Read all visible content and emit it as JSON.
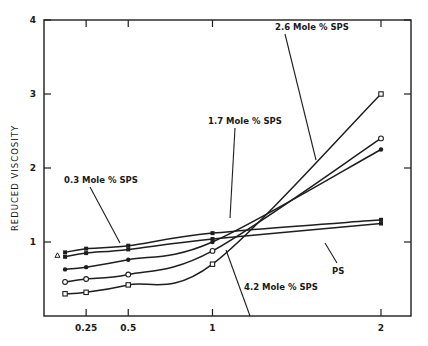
{
  "chart_data": {
    "type": "line",
    "title": "",
    "xlabel": "",
    "ylabel": "REDUCED VISCOSITY",
    "xlim": [
      0,
      2.15
    ],
    "ylim": [
      0,
      4
    ],
    "x_ticks": [
      0.25,
      0.5,
      1,
      2
    ],
    "x_tick_labels": [
      "0.25",
      "0.5",
      "1",
      "2"
    ],
    "y_ticks": [
      1,
      2,
      3,
      4
    ],
    "y_tick_labels": [
      "1",
      "2",
      "3",
      "4"
    ],
    "grid": false,
    "x": [
      0.125,
      0.25,
      0.5,
      1,
      2
    ],
    "series": [
      {
        "name": "0.3 Mole % SPS",
        "marker": "filled-square",
        "values": [
          0.86,
          0.91,
          0.95,
          1.12,
          1.3
        ]
      },
      {
        "name": "PS",
        "marker": "filled-square",
        "values": [
          0.8,
          0.85,
          0.9,
          1.04,
          1.25
        ]
      },
      {
        "name": "1.7 Mole % SPS",
        "marker": "filled-circle",
        "values": [
          0.63,
          0.66,
          0.76,
          1.0,
          2.25
        ]
      },
      {
        "name": "2.6 Mole % SPS",
        "marker": "open-circle",
        "values": [
          0.46,
          0.5,
          0.56,
          0.88,
          2.4
        ]
      },
      {
        "name": "4.2 Mole % SPS",
        "marker": "open-square",
        "values": [
          0.3,
          0.32,
          0.42,
          0.7,
          3.0
        ]
      }
    ],
    "extra_points": [
      {
        "x": 0.08,
        "y": 0.82,
        "marker": "triangle"
      }
    ],
    "annotations": [
      {
        "text": "2.6 Mole % SPS",
        "x": 1.55,
        "y": 3.3
      },
      {
        "text": "1.7 Mole % SPS",
        "x": 1.2,
        "y": 2.4
      },
      {
        "text": "0.3 Mole % SPS",
        "x": 0.1,
        "y": 1.72
      },
      {
        "text": "PS",
        "x": 1.72,
        "y": 0.82
      },
      {
        "text": "4.2 Mole % SPS",
        "x": 1.22,
        "y": 0.36
      }
    ],
    "legend": "none (inline labels with leader lines)"
  }
}
